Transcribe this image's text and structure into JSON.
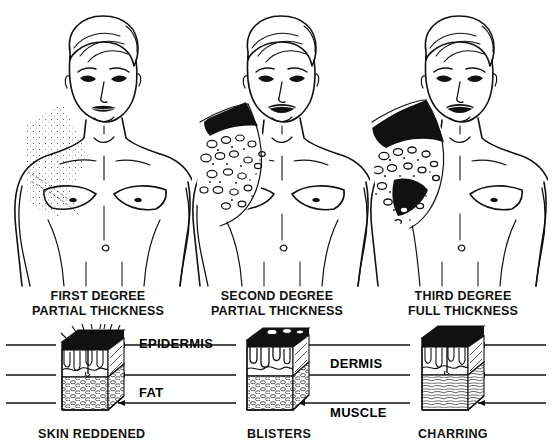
{
  "diagram": {
    "ink_color": "#111111",
    "background_color": "#ffffff"
  },
  "figures": [
    {
      "name": "first-degree-figure",
      "burn_pattern": "light-stipple-shoulder-chest",
      "severity": 1
    },
    {
      "name": "second-degree-figure",
      "burn_pattern": "blistered-shoulder-chest",
      "severity": 2
    },
    {
      "name": "third-degree-figure",
      "burn_pattern": "charred-black-shoulder-chest",
      "severity": 3
    }
  ],
  "degree_labels": [
    {
      "line1": "FIRST DEGREE",
      "line2": "PARTIAL THICKNESS"
    },
    {
      "line1": "SECOND DEGREE",
      "line2": "PARTIAL THICKNESS"
    },
    {
      "line1": "THIRD DEGREE",
      "line2": "FULL THICKNESS"
    }
  ],
  "layer_labels": [
    {
      "text": "EPIDERMIS",
      "x": 139,
      "y": 21
    },
    {
      "text": "DERMIS",
      "x": 330,
      "y": 41
    },
    {
      "text": "FAT",
      "x": 139,
      "y": 69
    },
    {
      "text": "MUSCLE",
      "x": 330,
      "y": 88
    }
  ],
  "result_labels": [
    "SKIN REDDENED",
    "BLISTERS",
    "CHARRING"
  ],
  "skin_blocks": [
    {
      "name": "first-degree-cross-section",
      "x": 60,
      "top_layer": "charred-hairy-epidermis"
    },
    {
      "name": "second-degree-cross-section",
      "x": 245,
      "top_layer": "blistered-epidermis"
    },
    {
      "name": "third-degree-cross-section",
      "x": 420,
      "top_layer": "charred-epidermis"
    }
  ]
}
